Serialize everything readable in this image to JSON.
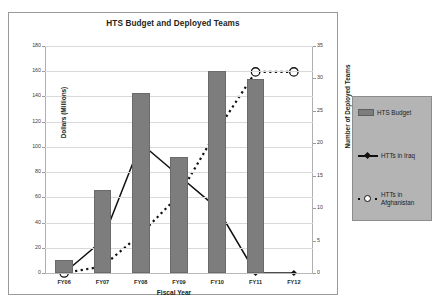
{
  "chart_data": {
    "type": "bar",
    "title": "HTS Budget and Deployed Teams",
    "xlabel": "Fiscal Year",
    "ylabel": "Dollars (Millions)",
    "y2label": "Number of Deployed Teams",
    "categories": [
      "FY06",
      "FY07",
      "FY08",
      "FY09",
      "FY10",
      "FY11",
      "FY12"
    ],
    "ylim": [
      0,
      180
    ],
    "y2lim": [
      0,
      35
    ],
    "yticks": [
      0,
      20,
      40,
      60,
      80,
      100,
      120,
      140,
      160,
      180
    ],
    "y2ticks": [
      0,
      5,
      10,
      15,
      20,
      25,
      30,
      35
    ],
    "grid": true,
    "legend_position": "right-outside",
    "series": [
      {
        "name": "HTS Budget",
        "type": "bar",
        "axis": "left",
        "unit": "Dollars (Millions)",
        "values": [
          10,
          66,
          143,
          92,
          160,
          154,
          0
        ],
        "color": "#7d7d7d"
      },
      {
        "name": "HTTs in Iraq",
        "type": "line",
        "axis": "right",
        "unit": "teams",
        "values": [
          0,
          5,
          20,
          15,
          10,
          0,
          0
        ],
        "color": "#111111",
        "linestyle": "solid",
        "marker": "diamond"
      },
      {
        "name": "HTTs in Afghanistan",
        "type": "line",
        "axis": "right",
        "unit": "teams",
        "values": [
          0,
          1,
          6,
          12,
          22,
          31,
          31
        ],
        "color": "#111111",
        "linestyle": "dotted",
        "marker": "circle-open"
      }
    ]
  },
  "legend": {
    "items": [
      {
        "label": "HTS Budget",
        "icon": "bar-swatch"
      },
      {
        "label": "HTTs in Iraq",
        "icon": "line-diamond-swatch"
      },
      {
        "label": "HTTs in Afghanistan",
        "icon": "dotted-circle-swatch"
      }
    ]
  }
}
